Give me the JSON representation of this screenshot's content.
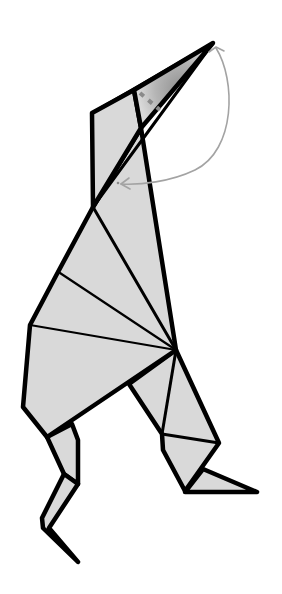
{
  "diagram": {
    "subject": "origami bird (standing figure) folding step",
    "colors": {
      "paper_fill": "#d9d9d9",
      "outline": "#000000",
      "head_shade": "#9e9e9e",
      "valley_fold": "#8a8a8a",
      "arrow": "#a3a3a3",
      "background": "#ffffff"
    },
    "elements": {
      "head": "pointed head / beak with shaded inside-reverse fold area",
      "fold_line": "dashed valley fold line across head",
      "fold_arrow": "curved arrow from beak tip back down to neck",
      "neck": "long neck panel",
      "body": "fan of triangular pleats converging on hip point",
      "left_leg": "thin zig-zag leg",
      "right_leg": "bent leg with triangular foot"
    }
  }
}
